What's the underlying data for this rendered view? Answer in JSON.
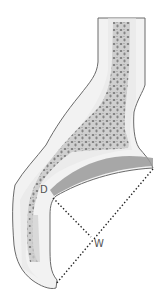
{
  "diagram": {
    "type": "anatomical-bone-cross-section",
    "labels": {
      "depth": "D",
      "width": "W"
    },
    "colors": {
      "outline": "#6a6a6a",
      "cortex": "#ececec",
      "marrow": "#cfcfcf",
      "trabeculae": "#7a7a7a",
      "cartilage": "#9a9a9a",
      "measure_line": "#222222"
    }
  }
}
